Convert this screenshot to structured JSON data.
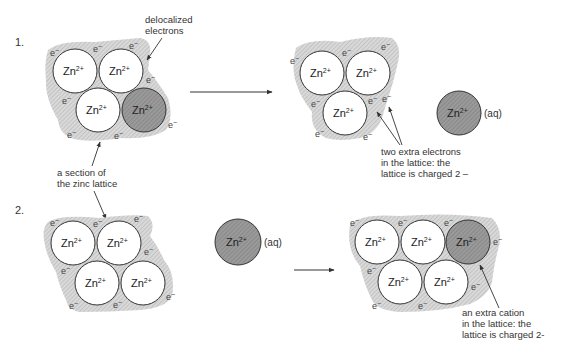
{
  "colors": {
    "background": "#ffffff",
    "ion_fill": "#ffffff",
    "ion_dark_fill": "#8f8f8f",
    "electron_sea": "#cfcfcf",
    "ink": "#333333"
  },
  "panel1": {
    "number": "1.",
    "left_lattice": {
      "ions": [
        {
          "label": "Zn",
          "charge": "2+",
          "cx": 75,
          "cy": 71,
          "dark": false
        },
        {
          "label": "Zn",
          "charge": "2+",
          "cx": 121,
          "cy": 71,
          "dark": false
        },
        {
          "label": "Zn",
          "charge": "2+",
          "cx": 98,
          "cy": 110,
          "dark": false
        },
        {
          "label": "Zn",
          "charge": "2+",
          "cx": 144,
          "cy": 110,
          "dark": true
        }
      ],
      "electrons": [
        "e⁻",
        "e⁻",
        "e⁻",
        "e⁻",
        "e⁻",
        "e⁻",
        "e⁻",
        "e⁻"
      ]
    },
    "label_delocalized": [
      "delocalized",
      "electrons"
    ],
    "label_section": [
      "a section of",
      "the zinc lattice"
    ],
    "right_lattice": {
      "ions": [
        {
          "label": "Zn",
          "charge": "2+",
          "cx": 322,
          "cy": 73,
          "dark": false
        },
        {
          "label": "Zn",
          "charge": "2+",
          "cx": 368,
          "cy": 73,
          "dark": false
        },
        {
          "label": "Zn",
          "charge": "2+",
          "cx": 345,
          "cy": 113,
          "dark": false
        }
      ],
      "electrons": [
        "e⁻",
        "e⁻",
        "e⁻",
        "e⁻",
        "e⁻",
        "e⁻",
        "e⁻",
        "e⁻"
      ]
    },
    "aq_ion": {
      "label": "Zn",
      "charge": "2+",
      "state": "(aq)"
    },
    "label_extra_electrons": [
      "two extra electrons",
      "in the lattice: the",
      "lattice is charged 2 –"
    ]
  },
  "panel2": {
    "number": "2.",
    "left_lattice": {
      "ions": [
        {
          "label": "Zn",
          "charge": "2+",
          "cx": 73,
          "cy": 243,
          "dark": false
        },
        {
          "label": "Zn",
          "charge": "2+",
          "cx": 119,
          "cy": 243,
          "dark": false
        },
        {
          "label": "Zn",
          "charge": "2+",
          "cx": 97,
          "cy": 283,
          "dark": false
        },
        {
          "label": "Zn",
          "charge": "2+",
          "cx": 143,
          "cy": 283,
          "dark": false
        }
      ],
      "electrons": [
        "e⁻",
        "e⁻",
        "e⁻",
        "e⁻",
        "e⁻",
        "e⁻",
        "e⁻",
        "e⁻"
      ]
    },
    "aq_ion": {
      "label": "Zn",
      "charge": "2+",
      "state": "(aq)"
    },
    "right_lattice": {
      "ions": [
        {
          "label": "Zn",
          "charge": "2+",
          "cx": 377,
          "cy": 242,
          "dark": false
        },
        {
          "label": "Zn",
          "charge": "2+",
          "cx": 423,
          "cy": 242,
          "dark": false
        },
        {
          "label": "Zn",
          "charge": "2+",
          "cx": 468,
          "cy": 242,
          "dark": true
        },
        {
          "label": "Zn",
          "charge": "2+",
          "cx": 400,
          "cy": 282,
          "dark": false
        },
        {
          "label": "Zn",
          "charge": "2+",
          "cx": 446,
          "cy": 282,
          "dark": false
        }
      ],
      "electrons": [
        "e⁻",
        "e⁻",
        "e⁻",
        "e⁻",
        "e⁻",
        "e⁻",
        "e⁻",
        "e⁻",
        "e⁻"
      ]
    },
    "label_extra_cation": [
      "an extra cation",
      "in the lattice: the",
      "lattice is charged 2-"
    ]
  },
  "text": {
    "zn": "Zn",
    "charge": "2+",
    "electron": "e",
    "electron_charge": "−"
  }
}
